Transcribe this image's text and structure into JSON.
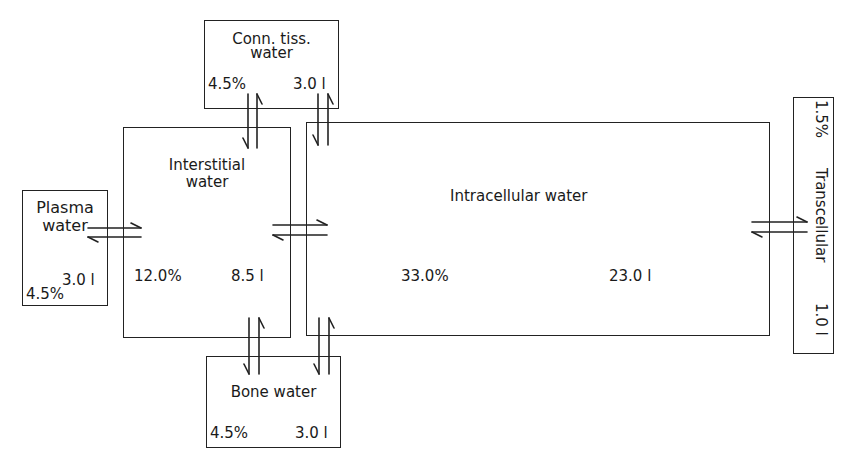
{
  "compartments": {
    "plasma": {
      "label_line1": "Plasma",
      "label_line2": "water",
      "percent": "4.5%",
      "volume": "3.0 l"
    },
    "interstitial": {
      "label_line1": "Interstitial",
      "label_line2": "water",
      "percent": "12.0%",
      "volume": "8.5 l"
    },
    "intracellular": {
      "label": "Intracellular water",
      "percent": "33.0%",
      "volume": "23.0 l"
    },
    "connective_tissue": {
      "label_line1": "Conn. tiss.",
      "label_line2": "water",
      "percent": "4.5%",
      "volume": "3.0 l"
    },
    "bone": {
      "label": "Bone water",
      "percent": "4.5%",
      "volume": "3.0 l"
    },
    "transcellular": {
      "percent": "1.5%",
      "label": "Transcellular",
      "volume": "1.0 l"
    }
  },
  "exchanges": [
    {
      "from": "plasma",
      "to": "interstitial",
      "symbol": "bidirectional"
    },
    {
      "from": "interstitial",
      "to": "intracellular",
      "symbol": "bidirectional"
    },
    {
      "from": "intracellular",
      "to": "transcellular",
      "symbol": "bidirectional"
    },
    {
      "from": "connective_tissue",
      "to": "interstitial",
      "symbol": "bidirectional"
    },
    {
      "from": "connective_tissue",
      "to": "intracellular",
      "symbol": "bidirectional"
    },
    {
      "from": "bone",
      "to": "interstitial",
      "symbol": "bidirectional"
    },
    {
      "from": "bone",
      "to": "intracellular",
      "symbol": "bidirectional"
    }
  ]
}
